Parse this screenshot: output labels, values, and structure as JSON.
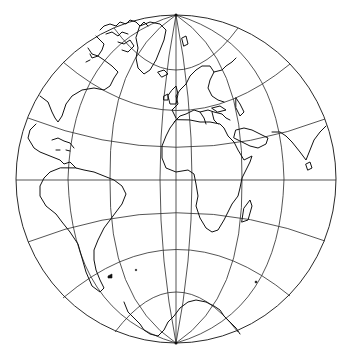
{
  "map": {
    "type": "world-globe-projection",
    "projection_shape": "ellipse",
    "center": [
      176,
      179
    ],
    "radius_x": 160,
    "radius_y": 164,
    "north_pole": [
      176,
      15
    ],
    "south_pole": [
      176,
      343
    ],
    "colors": {
      "background": "#ffffff",
      "graticule": "#2a2a2a",
      "coastline": "#111111"
    },
    "graticule": {
      "meridian_equator_offsets": [
        -160,
        -108,
        -66,
        -32,
        0,
        32,
        66,
        108,
        160
      ],
      "parallel_center_y": [
        70,
        110,
        147,
        180,
        213,
        250,
        292
      ]
    },
    "visible_regions": [
      "North America",
      "Greenland",
      "Canadian Arctic Archipelago",
      "Europe",
      "Africa",
      "Madagascar",
      "Arabian Peninsula",
      "India",
      "Sri Lanka",
      "South America",
      "Antarctica"
    ],
    "labels": []
  }
}
